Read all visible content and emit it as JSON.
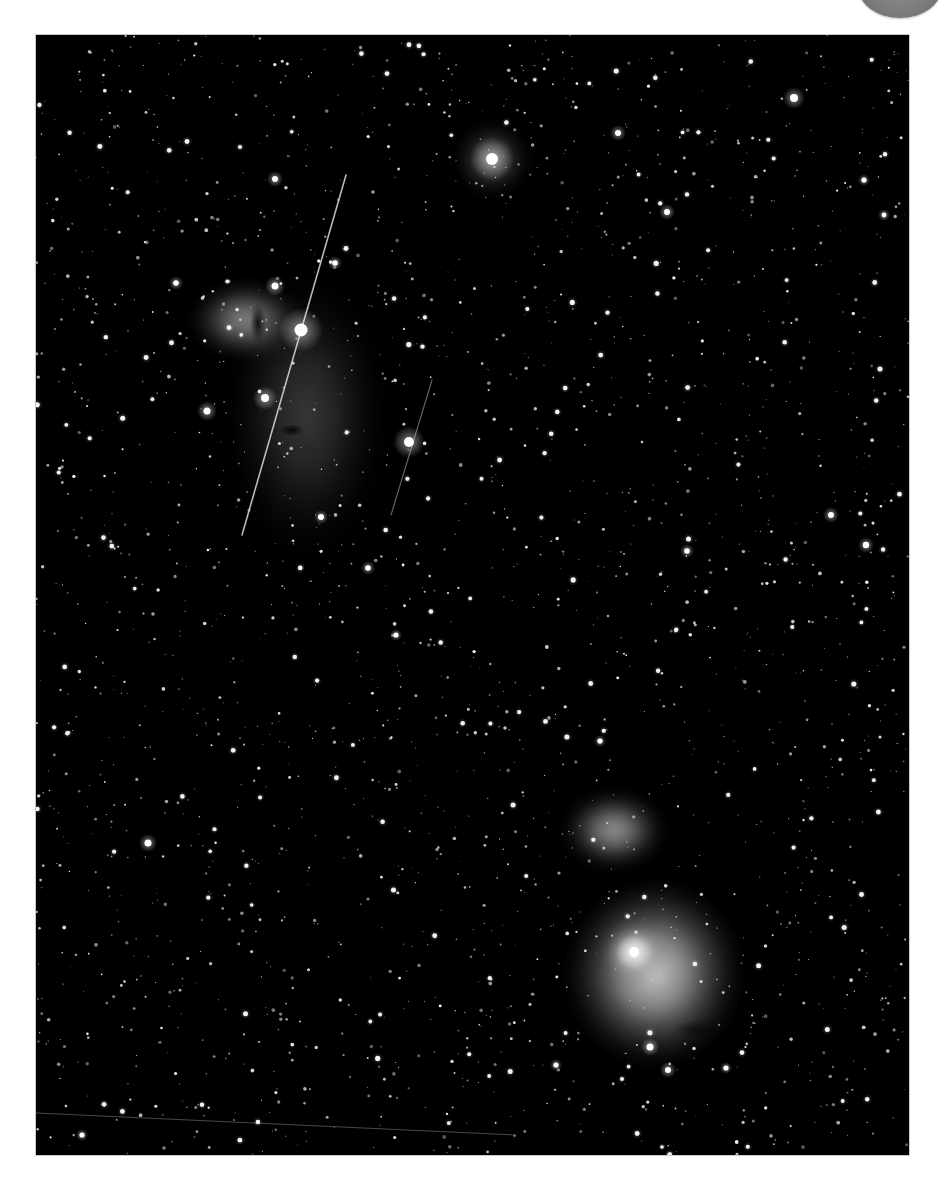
{
  "page": {
    "background": "#ffffff",
    "corner_badge": {
      "shape": "circle-partial",
      "color": "#7e7e7e"
    }
  },
  "photo": {
    "subject": "Orion belt region astrophotograph",
    "frame": {
      "x": 36,
      "y": 35,
      "width": 873,
      "height": 1120,
      "background": "#000000"
    },
    "features": [
      {
        "name": "flame-nebula",
        "cx": 210,
        "cy": 285,
        "rx": 60,
        "ry": 42,
        "opacity": 0.55
      },
      {
        "name": "horsehead-region-glow",
        "cx": 270,
        "cy": 380,
        "rx": 85,
        "ry": 150,
        "opacity": 0.22
      },
      {
        "name": "running-man-nebula",
        "cx": 578,
        "cy": 795,
        "rx": 55,
        "ry": 42,
        "opacity": 0.6
      },
      {
        "name": "orion-nebula",
        "cx": 618,
        "cy": 938,
        "rx": 95,
        "ry": 100,
        "opacity": 0.8
      },
      {
        "name": "orion-nebula-core",
        "cx": 598,
        "cy": 917,
        "rx": 32,
        "ry": 30,
        "opacity": 0.95
      },
      {
        "name": "star-cluster-glow",
        "cx": 456,
        "cy": 124,
        "rx": 40,
        "ry": 40,
        "opacity": 0.35
      }
    ],
    "dark_lanes": [
      {
        "name": "flame-dark-lane",
        "cx": 222,
        "cy": 288,
        "rx": 8,
        "ry": 20,
        "opacity": 0.85
      },
      {
        "name": "horsehead-silhouette",
        "cx": 256,
        "cy": 395,
        "rx": 12,
        "ry": 6,
        "opacity": 0.9
      },
      {
        "name": "orion-dark-lane",
        "cx": 590,
        "cy": 845,
        "rx": 30,
        "ry": 12,
        "opacity": 0.75
      },
      {
        "name": "orion-fish-mouth",
        "cx": 660,
        "cy": 995,
        "rx": 22,
        "ry": 10,
        "opacity": 0.55
      }
    ],
    "streaks": [
      {
        "name": "satellite-trail-long",
        "x1": 310,
        "y1": 140,
        "x2": 206,
        "y2": 500,
        "width": 1.6,
        "opacity": 0.8
      },
      {
        "name": "satellite-trail-short",
        "x1": 396,
        "y1": 345,
        "x2": 355,
        "y2": 480,
        "width": 1.1,
        "opacity": 0.45
      },
      {
        "name": "bottom-trail",
        "x1": 0,
        "y1": 1078,
        "x2": 480,
        "y2": 1100,
        "width": 0.9,
        "opacity": 0.35
      }
    ],
    "bright_stars": [
      {
        "name": "alnitak",
        "x": 265,
        "y": 295,
        "r": 6.5,
        "halo": 22
      },
      {
        "name": "alnilam-area",
        "x": 456,
        "y": 124,
        "r": 6,
        "halo": 22
      },
      {
        "name": "sigma-ori",
        "x": 373,
        "y": 407,
        "r": 5,
        "halo": 16
      },
      {
        "name": "trapezium",
        "x": 598,
        "y": 917,
        "r": 5,
        "halo": 18
      },
      {
        "name": "star-ne",
        "x": 758,
        "y": 63,
        "r": 4,
        "halo": 11
      },
      {
        "name": "star-flame-1",
        "x": 239,
        "y": 251,
        "r": 3.5,
        "halo": 10
      },
      {
        "name": "star-flame-2",
        "x": 229,
        "y": 363,
        "r": 4,
        "halo": 12
      },
      {
        "name": "star-flame-3",
        "x": 171,
        "y": 376,
        "r": 3.5,
        "halo": 10
      },
      {
        "name": "star-c1",
        "x": 239,
        "y": 144,
        "r": 3,
        "halo": 8
      },
      {
        "name": "star-c2",
        "x": 582,
        "y": 98,
        "r": 3,
        "halo": 8
      },
      {
        "name": "star-c3",
        "x": 631,
        "y": 177,
        "r": 3,
        "halo": 8
      },
      {
        "name": "star-c4",
        "x": 112,
        "y": 808,
        "r": 3.5,
        "halo": 9
      },
      {
        "name": "star-c5",
        "x": 830,
        "y": 510,
        "r": 3.2,
        "halo": 8
      },
      {
        "name": "star-c6",
        "x": 795,
        "y": 480,
        "r": 3,
        "halo": 8
      },
      {
        "name": "star-c7",
        "x": 651,
        "y": 516,
        "r": 2.8,
        "halo": 7
      },
      {
        "name": "star-c8",
        "x": 332,
        "y": 533,
        "r": 2.8,
        "halo": 7
      },
      {
        "name": "star-c9",
        "x": 614,
        "y": 1012,
        "r": 3.5,
        "halo": 9
      },
      {
        "name": "star-c10",
        "x": 632,
        "y": 1035,
        "r": 3,
        "halo": 8
      },
      {
        "name": "star-c11",
        "x": 285,
        "y": 482,
        "r": 3,
        "halo": 7
      },
      {
        "name": "star-c12",
        "x": 299,
        "y": 228,
        "r": 2.8,
        "halo": 7
      },
      {
        "name": "star-c13",
        "x": 140,
        "y": 248,
        "r": 2.8,
        "halo": 7
      },
      {
        "name": "star-c14",
        "x": 690,
        "y": 1033,
        "r": 2.6,
        "halo": 6
      },
      {
        "name": "star-c15",
        "x": 520,
        "y": 1030,
        "r": 2.6,
        "halo": 6
      },
      {
        "name": "star-c16",
        "x": 564,
        "y": 706,
        "r": 2.6,
        "halo": 6
      },
      {
        "name": "star-c17",
        "x": 360,
        "y": 600,
        "r": 2.6,
        "halo": 6
      },
      {
        "name": "star-c18",
        "x": 828,
        "y": 145,
        "r": 2.6,
        "halo": 6
      },
      {
        "name": "star-c19",
        "x": 848,
        "y": 180,
        "r": 2.4,
        "halo": 6
      },
      {
        "name": "star-c20",
        "x": 46,
        "y": 1100,
        "r": 2.6,
        "halo": 6
      }
    ],
    "faint_stars": {
      "count": 2100,
      "seed": 7,
      "min_r": 0.5,
      "max_r": 1.9,
      "min_alpha": 0.35,
      "max_alpha": 0.95
    },
    "medium_stars": {
      "count": 160,
      "seed": 21,
      "min_r": 1.8,
      "max_r": 2.6
    }
  }
}
